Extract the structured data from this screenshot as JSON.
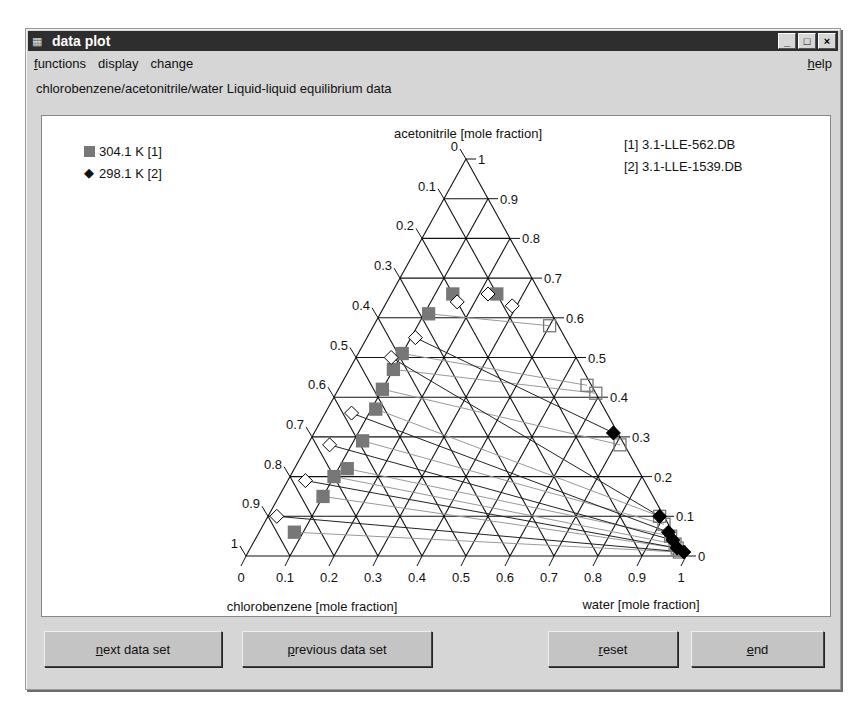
{
  "window": {
    "title": "data plot",
    "controls": {
      "minimize": "_",
      "maximize": "□",
      "close": "×"
    }
  },
  "menu": {
    "items": [
      {
        "label": "functions",
        "mnemonic": "f"
      },
      {
        "label": "display"
      },
      {
        "label": "change"
      }
    ],
    "help": {
      "label": "help",
      "mnemonic": "h"
    }
  },
  "subtitle": "chlorobenzene/acetonitrile/water  Liquid-liquid equilibrium data",
  "legend": [
    {
      "marker": "square",
      "label": "304.1 K [1]",
      "color": "#777777"
    },
    {
      "marker": "diamond",
      "label": "298.1 K [2]",
      "color": "#000000"
    }
  ],
  "references": [
    "[1] 3.1-LLE-562.DB",
    "[2] 3.1-LLE-1539.DB"
  ],
  "buttons": {
    "next": {
      "label": "next data set",
      "mnemonic": "n"
    },
    "previous": {
      "label": "previous data set",
      "mnemonic": "p"
    },
    "reset": {
      "label": "reset",
      "mnemonic": "r"
    },
    "end": {
      "label": "end",
      "mnemonic": "e"
    }
  },
  "chart_data": {
    "type": "scatter",
    "subtype": "ternary",
    "title": "chlorobenzene/acetonitrile/water Liquid-liquid equilibrium data",
    "axes": {
      "top": "acetonitrile [mole fraction]",
      "bottom_left": "chlorobenzene [mole fraction]",
      "bottom_right": "water [mole fraction]"
    },
    "ticks": {
      "left": [
        "0",
        "0.1",
        "0.2",
        "0.3",
        "0.4",
        "0.5",
        "0.6",
        "0.7",
        "0.8",
        "0.9",
        "1"
      ],
      "right": [
        "1",
        "0.9",
        "0.8",
        "0.7",
        "0.6",
        "0.5",
        "0.4",
        "0.3",
        "0.2",
        "0.1",
        "0"
      ],
      "bottom": [
        "0",
        "0.1",
        "0.2",
        "0.3",
        "0.4",
        "0.5",
        "0.6",
        "0.7",
        "0.8",
        "0.9",
        "1"
      ]
    },
    "grid": true,
    "series": [
      {
        "name": "304.1 K [1]",
        "marker": "square",
        "organic_phase": [
          {
            "acetonitrile": 0.06,
            "water": 0.08
          },
          {
            "acetonitrile": 0.15,
            "water": 0.1
          },
          {
            "acetonitrile": 0.2,
            "water": 0.1
          },
          {
            "acetonitrile": 0.22,
            "water": 0.12
          },
          {
            "acetonitrile": 0.29,
            "water": 0.12
          },
          {
            "acetonitrile": 0.37,
            "water": 0.11
          },
          {
            "acetonitrile": 0.42,
            "water": 0.1
          },
          {
            "acetonitrile": 0.47,
            "water": 0.1
          },
          {
            "acetonitrile": 0.51,
            "water": 0.1
          },
          {
            "acetonitrile": 0.61,
            "water": 0.11
          },
          {
            "acetonitrile": 0.66,
            "water": 0.14
          },
          {
            "acetonitrile": 0.66,
            "water": 0.24
          }
        ],
        "aqueous_phase": [
          {
            "acetonitrile": 0.58,
            "water": 0.4
          },
          {
            "acetonitrile": 0.43,
            "water": 0.56
          },
          {
            "acetonitrile": 0.41,
            "water": 0.59
          },
          {
            "acetonitrile": 0.28,
            "water": 0.71
          },
          {
            "acetonitrile": 0.1,
            "water": 0.89
          },
          {
            "acetonitrile": 0.08,
            "water": 0.91
          },
          {
            "acetonitrile": 0.05,
            "water": 0.94
          },
          {
            "acetonitrile": 0.03,
            "water": 0.96
          },
          {
            "acetonitrile": 0.02,
            "water": 0.97
          },
          {
            "acetonitrile": 0.01,
            "water": 0.98
          }
        ]
      },
      {
        "name": "298.1 K [2]",
        "marker": "diamond",
        "organic_phase": [
          {
            "acetonitrile": 0.1,
            "water": 0.02
          },
          {
            "acetonitrile": 0.19,
            "water": 0.04
          },
          {
            "acetonitrile": 0.28,
            "water": 0.05
          },
          {
            "acetonitrile": 0.36,
            "water": 0.06
          },
          {
            "acetonitrile": 0.5,
            "water": 0.08
          },
          {
            "acetonitrile": 0.55,
            "water": 0.11
          },
          {
            "acetonitrile": 0.64,
            "water": 0.16
          },
          {
            "acetonitrile": 0.66,
            "water": 0.22
          },
          {
            "acetonitrile": 0.63,
            "water": 0.29
          }
        ],
        "aqueous_phase": [
          {
            "acetonitrile": 0.31,
            "water": 0.68
          },
          {
            "acetonitrile": 0.1,
            "water": 0.89
          },
          {
            "acetonitrile": 0.06,
            "water": 0.93
          },
          {
            "acetonitrile": 0.04,
            "water": 0.95
          },
          {
            "acetonitrile": 0.02,
            "water": 0.97
          },
          {
            "acetonitrile": 0.01,
            "water": 0.99
          }
        ]
      }
    ]
  }
}
